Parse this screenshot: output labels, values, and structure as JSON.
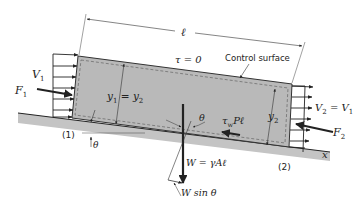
{
  "diagram": {
    "labels": {
      "length": "ℓ",
      "tau_top": "τ = 0",
      "control_surface": "Control surface",
      "v1": "V",
      "v1_sub": "1",
      "f1": "F",
      "f1_sub": "1",
      "depth_eq_a": "y",
      "depth_eq_a_sub": "1",
      "depth_eq_mid": " = ",
      "depth_eq_b": "y",
      "depth_eq_b_sub": "2",
      "y2": "y",
      "y2_sub": "2",
      "v2_lhs": "V",
      "v2_lhs_sub": "2",
      "v2_mid": " = ",
      "v2_rhs": "V",
      "v2_rhs_sub": "1",
      "f2": "F",
      "f2_sub": "2",
      "theta_angle": "θ",
      "theta_ground": "θ",
      "shear_tau": "τ",
      "shear_tau_sub": "w",
      "shear_rest": "Pℓ",
      "section1": "(1)",
      "section2": "(2)",
      "weight": "W = γAℓ",
      "weight_component": "W sin θ",
      "x_axis": "x"
    },
    "colors": {
      "fluid_fill": "#b9b9b9",
      "ground_fill": "#c4c4c4",
      "line": "#222222",
      "background": "#ffffff"
    }
  }
}
